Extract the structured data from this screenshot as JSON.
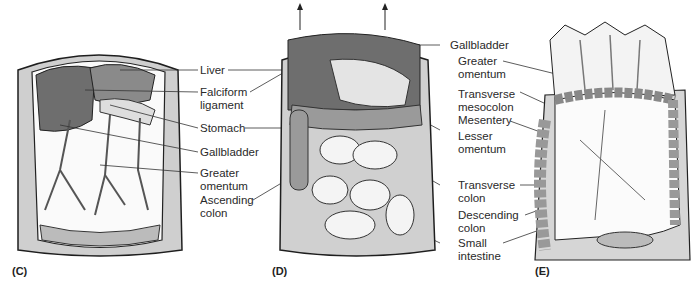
{
  "figure": {
    "panels": [
      {
        "id": "C",
        "label": "(C)"
      },
      {
        "id": "D",
        "label": "(D)"
      },
      {
        "id": "E",
        "label": "(E)"
      }
    ],
    "labels_middle": [
      {
        "text": "Liver"
      },
      {
        "text": "Falciform\nligament"
      },
      {
        "text": "Stomach"
      },
      {
        "text": "Gallbladder"
      },
      {
        "text": "Greater\nomentum"
      },
      {
        "text": "Ascending\ncolon"
      }
    ],
    "labels_right": [
      {
        "text": "Gallbladder"
      },
      {
        "text": "Greater\nomentum"
      },
      {
        "text": "Transverse\nmesocolon"
      },
      {
        "text": "Mesentery"
      },
      {
        "text": "Lesser\nomentum"
      },
      {
        "text": "Transverse\ncolon"
      },
      {
        "text": "Descending\ncolon"
      },
      {
        "text": "Small\nintestine"
      }
    ],
    "colors": {
      "dark_organ": "#6e6e6e",
      "mid_organ": "#a8a8a8",
      "light_organ": "#e6e6e6",
      "outline": "#1e1e1e"
    }
  }
}
